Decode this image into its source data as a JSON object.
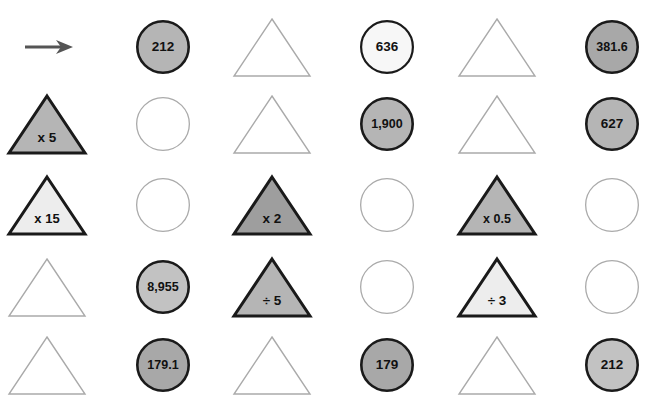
{
  "page": {
    "background_color": "#ffffff",
    "columns": 6,
    "rows": 5
  },
  "palette": {
    "circle_fill_medium": "#b5b5b5",
    "circle_fill_dark": "#a8a8a8",
    "circle_fill_light": "#c2c2c2",
    "circle_fill_white": "#f7f7f7",
    "circle_fill_empty": "#ffffff",
    "circle_stroke_dark": "#1a1a1a",
    "circle_stroke_light": "#aaaaaa",
    "triangle_fill_medium": "#b5b5b5",
    "triangle_fill_dark": "#9e9e9e",
    "triangle_fill_light": "#ededed",
    "triangle_fill_empty": "#ffffff",
    "triangle_stroke_dark": "#1a1a1a",
    "triangle_stroke_light": "#aaaaaa",
    "arrow_color": "#555555",
    "text_color": "#111111"
  },
  "arrow": {
    "name": "input-arrow",
    "direction": "right"
  },
  "grid": [
    {
      "row": 1,
      "cells": [
        {
          "col": 1,
          "shape": "arrow",
          "label": "",
          "style": "arrow"
        },
        {
          "col": 2,
          "shape": "circle",
          "label": "212",
          "style": "filled-medium"
        },
        {
          "col": 3,
          "shape": "triangle",
          "label": "",
          "style": "empty"
        },
        {
          "col": 4,
          "shape": "circle",
          "label": "636",
          "style": "filled-white"
        },
        {
          "col": 5,
          "shape": "triangle",
          "label": "",
          "style": "empty"
        },
        {
          "col": 6,
          "shape": "circle",
          "label": "381.6",
          "style": "filled-dark"
        }
      ]
    },
    {
      "row": 2,
      "cells": [
        {
          "col": 1,
          "shape": "triangle",
          "label": "x 5",
          "style": "filled-medium"
        },
        {
          "col": 2,
          "shape": "circle",
          "label": "",
          "style": "empty"
        },
        {
          "col": 3,
          "shape": "triangle",
          "label": "",
          "style": "empty"
        },
        {
          "col": 4,
          "shape": "circle",
          "label": "1,900",
          "style": "filled-medium"
        },
        {
          "col": 5,
          "shape": "triangle",
          "label": "",
          "style": "empty"
        },
        {
          "col": 6,
          "shape": "circle",
          "label": "627",
          "style": "filled-medium"
        }
      ]
    },
    {
      "row": 3,
      "cells": [
        {
          "col": 1,
          "shape": "triangle",
          "label": "x 15",
          "style": "filled-light"
        },
        {
          "col": 2,
          "shape": "circle",
          "label": "",
          "style": "empty"
        },
        {
          "col": 3,
          "shape": "triangle",
          "label": "x 2",
          "style": "filled-dark"
        },
        {
          "col": 4,
          "shape": "circle",
          "label": "",
          "style": "empty"
        },
        {
          "col": 5,
          "shape": "triangle",
          "label": "x 0.5",
          "style": "filled-medium"
        },
        {
          "col": 6,
          "shape": "circle",
          "label": "",
          "style": "empty"
        }
      ]
    },
    {
      "row": 4,
      "cells": [
        {
          "col": 1,
          "shape": "triangle",
          "label": "",
          "style": "empty"
        },
        {
          "col": 2,
          "shape": "circle",
          "label": "8,955",
          "style": "filled-light"
        },
        {
          "col": 3,
          "shape": "triangle",
          "label": "÷ 5",
          "style": "filled-medium"
        },
        {
          "col": 4,
          "shape": "circle",
          "label": "",
          "style": "empty"
        },
        {
          "col": 5,
          "shape": "triangle",
          "label": "÷ 3",
          "style": "filled-light"
        },
        {
          "col": 6,
          "shape": "circle",
          "label": "",
          "style": "empty"
        }
      ]
    },
    {
      "row": 5,
      "cells": [
        {
          "col": 1,
          "shape": "triangle",
          "label": "",
          "style": "empty"
        },
        {
          "col": 2,
          "shape": "circle",
          "label": "179.1",
          "style": "filled-dark"
        },
        {
          "col": 3,
          "shape": "triangle",
          "label": "",
          "style": "empty"
        },
        {
          "col": 4,
          "shape": "circle",
          "label": "179",
          "style": "filled-dark"
        },
        {
          "col": 5,
          "shape": "triangle",
          "label": "",
          "style": "empty"
        },
        {
          "col": 6,
          "shape": "circle",
          "label": "212",
          "style": "filled-light"
        }
      ]
    }
  ],
  "layout": {
    "column_centers": [
      47,
      163,
      272,
      387,
      497,
      612
    ],
    "row_centers": [
      47,
      124,
      205,
      287,
      365
    ],
    "circle_radius": 27,
    "triangle_half_width": 38,
    "triangle_height": 57
  }
}
